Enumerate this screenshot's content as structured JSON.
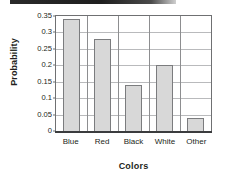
{
  "figure": {
    "background_color": "#ffffff",
    "crop_artifact": {
      "name": "top-dark-band",
      "color": "#1e1e1e"
    }
  },
  "chart_data": {
    "type": "bar",
    "title": "",
    "categories": [
      "Blue",
      "Red",
      "Black",
      "White",
      "Other"
    ],
    "values": [
      0.34,
      0.28,
      0.14,
      0.2,
      0.04
    ],
    "xlabel": "Colors",
    "ylabel": "Probability",
    "ylim": [
      0,
      0.35
    ],
    "ytick_values": [
      0,
      0.05,
      0.1,
      0.15,
      0.2,
      0.25,
      0.3,
      0.35
    ],
    "ytick_labels": [
      "0",
      "0.05",
      "0.1",
      "0.15",
      "0.2",
      "0.25",
      "0.3",
      "0.35"
    ],
    "grid": true,
    "grid_axis": "y",
    "legend": false,
    "bar_fill_color": "#d8d8d8",
    "bar_edge_color": "#7b7c7e",
    "axis_color": "#6f7072",
    "gridline_color": "#b9babc",
    "text_color": "#231f20"
  }
}
